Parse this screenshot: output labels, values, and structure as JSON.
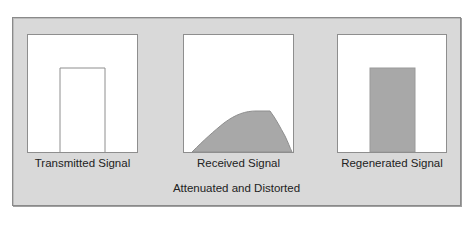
{
  "diagram": {
    "colors": {
      "frame_bg": "#d9d9d9",
      "box_bg": "#ffffff",
      "box_border": "#8e8e8e",
      "signal_fill": "#a8a8a8",
      "signal_outline": "#8e8e8e",
      "text": "#222222"
    },
    "panels": [
      {
        "id": "transmitted",
        "label": "Transmitted Signal",
        "shape": "outlined-rectangle"
      },
      {
        "id": "received",
        "label": "Received Signal",
        "shape": "attenuated-distorted-curve"
      },
      {
        "id": "regenerated",
        "label": "Regenerated Signal",
        "shape": "filled-rectangle"
      }
    ],
    "caption": "Attenuated and Distorted"
  }
}
